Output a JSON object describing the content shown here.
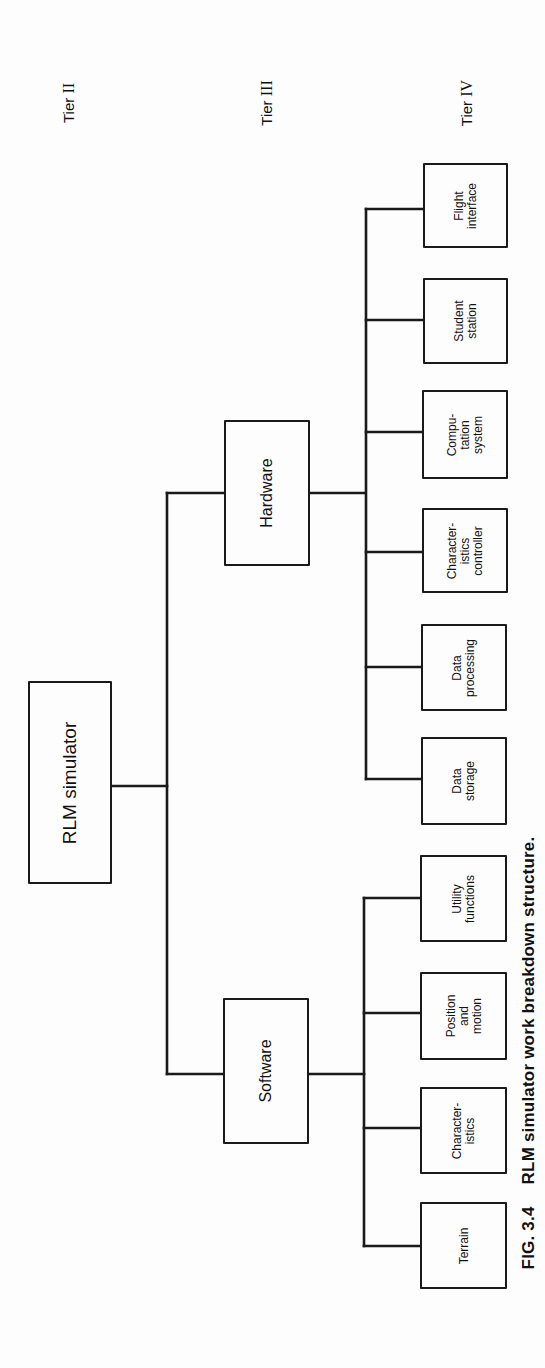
{
  "figure": {
    "caption_number": "FIG. 3.4",
    "caption_text": "RLM simulator work breakdown structure.",
    "orientation": "rotated 90° counter-clockwise"
  },
  "tiers": [
    {
      "label": "Tier",
      "numeral": "II"
    },
    {
      "label": "Tier",
      "numeral": "III"
    },
    {
      "label": "Tier",
      "numeral": "IV"
    }
  ],
  "tree": {
    "root": {
      "label": "RLM simulator"
    },
    "tier3": [
      {
        "id": "hardware",
        "label": "Hardware"
      },
      {
        "id": "software",
        "label": "Software"
      }
    ],
    "hardware_children": [
      {
        "lines": [
          "Flight",
          "interface"
        ]
      },
      {
        "lines": [
          "Student",
          "station"
        ]
      },
      {
        "lines": [
          "Compu-",
          "tation",
          "system"
        ]
      },
      {
        "lines": [
          "Character-",
          "istics",
          "controller"
        ]
      },
      {
        "lines": [
          "Data",
          "processing"
        ]
      },
      {
        "lines": [
          "Data",
          "storage"
        ]
      }
    ],
    "software_children": [
      {
        "lines": [
          "Utility",
          "functions"
        ]
      },
      {
        "lines": [
          "Position",
          "and",
          "motion"
        ]
      },
      {
        "lines": [
          "Character-",
          "istics"
        ]
      },
      {
        "lines": [
          "Terrain"
        ]
      }
    ]
  },
  "colors": {
    "line": "#1a1a1a",
    "background": "#fdfdfd"
  }
}
